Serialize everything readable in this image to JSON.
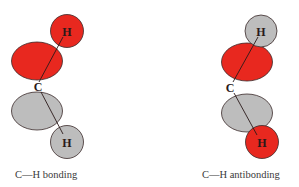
{
  "colors": {
    "positive_phase": "#e8281f",
    "negative_phase": "#bdbdbd",
    "outline": "#3a2a2a",
    "text": "#333333"
  },
  "diagrams": [
    {
      "id": "bonding",
      "caption": "C—H bonding",
      "top_atom": {
        "label": "H",
        "phase": "positive"
      },
      "top_lobe": {
        "phase": "positive"
      },
      "center_atom": {
        "label": "C"
      },
      "bottom_lobe": {
        "phase": "negative"
      },
      "bottom_atom": {
        "label": "H",
        "phase": "negative"
      }
    },
    {
      "id": "antibonding",
      "caption": "C—H antibonding",
      "top_atom": {
        "label": "H",
        "phase": "negative"
      },
      "top_lobe": {
        "phase": "positive"
      },
      "center_atom": {
        "label": "C"
      },
      "bottom_lobe": {
        "phase": "negative"
      },
      "bottom_atom": {
        "label": "H",
        "phase": "positive"
      }
    }
  ]
}
